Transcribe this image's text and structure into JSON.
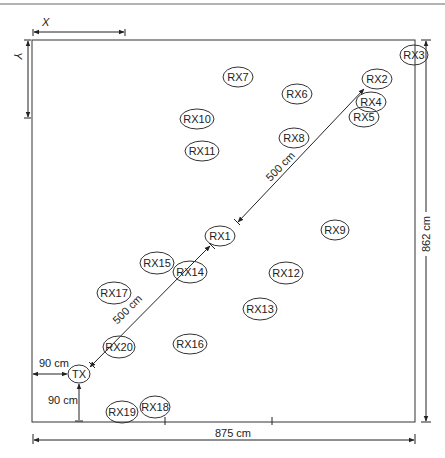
{
  "diagram": {
    "axis_labels": {
      "x": "X",
      "y": "Y"
    },
    "dimensions": {
      "width": "875 cm",
      "height": "862 cm",
      "tx_offset_x": "90 cm",
      "tx_offset_y": "90 cm",
      "tx_to_rx1": "500 cm",
      "rx1_to_rx2": "500 cm"
    },
    "nodes": [
      {
        "id": "RX3",
        "label": "RX3",
        "cx": 414,
        "cy": 55,
        "rx": 14,
        "ry": 10
      },
      {
        "id": "RX2",
        "label": "RX2",
        "cx": 377,
        "cy": 79,
        "rx": 15,
        "ry": 10
      },
      {
        "id": "RX4",
        "label": "RX4",
        "cx": 371,
        "cy": 102,
        "rx": 15,
        "ry": 10
      },
      {
        "id": "RX5",
        "label": "RX5",
        "cx": 364,
        "cy": 117,
        "rx": 15,
        "ry": 10
      },
      {
        "id": "RX7",
        "label": "RX7",
        "cx": 238,
        "cy": 77,
        "rx": 15,
        "ry": 10
      },
      {
        "id": "RX6",
        "label": "RX6",
        "cx": 297,
        "cy": 94,
        "rx": 15,
        "ry": 10
      },
      {
        "id": "RX10",
        "label": "RX10",
        "cx": 197,
        "cy": 119,
        "rx": 17,
        "ry": 10
      },
      {
        "id": "RX11",
        "label": "RX11",
        "cx": 202,
        "cy": 151,
        "rx": 17,
        "ry": 10
      },
      {
        "id": "RX8",
        "label": "RX8",
        "cx": 294,
        "cy": 138,
        "rx": 15,
        "ry": 10
      },
      {
        "id": "RX1",
        "label": "RX1",
        "cx": 220,
        "cy": 236,
        "rx": 15,
        "ry": 10
      },
      {
        "id": "RX9",
        "label": "RX9",
        "cx": 335,
        "cy": 230,
        "rx": 14,
        "ry": 10
      },
      {
        "id": "RX15",
        "label": "RX15",
        "cx": 157,
        "cy": 263,
        "rx": 17,
        "ry": 11
      },
      {
        "id": "RX14",
        "label": "RX14",
        "cx": 190,
        "cy": 272,
        "rx": 17,
        "ry": 11
      },
      {
        "id": "RX12",
        "label": "RX12",
        "cx": 286,
        "cy": 273,
        "rx": 17,
        "ry": 11
      },
      {
        "id": "RX17",
        "label": "RX17",
        "cx": 114,
        "cy": 293,
        "rx": 17,
        "ry": 11
      },
      {
        "id": "RX13",
        "label": "RX13",
        "cx": 260,
        "cy": 309,
        "rx": 17,
        "ry": 11
      },
      {
        "id": "RX20",
        "label": "RX20",
        "cx": 119,
        "cy": 347,
        "rx": 16,
        "ry": 11
      },
      {
        "id": "RX16",
        "label": "RX16",
        "cx": 190,
        "cy": 344,
        "rx": 17,
        "ry": 10
      },
      {
        "id": "TX",
        "label": "TX",
        "cx": 79,
        "cy": 374,
        "rx": 11,
        "ry": 9
      },
      {
        "id": "RX19",
        "label": "RX19",
        "cx": 122,
        "cy": 412,
        "rx": 16,
        "ry": 11
      },
      {
        "id": "RX18",
        "label": "RX18",
        "cx": 155,
        "cy": 407,
        "rx": 15,
        "ry": 11
      }
    ]
  }
}
